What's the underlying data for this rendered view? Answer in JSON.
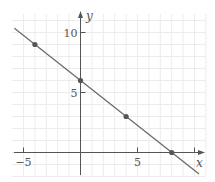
{
  "chart_data": {
    "type": "line",
    "title": "",
    "xlabel": "x",
    "ylabel": "y",
    "xlim": [
      -5.7,
      10.8
    ],
    "ylim": [
      -1.8,
      11.2
    ],
    "grid": true,
    "x_ticks": [
      {
        "value": -5,
        "label": "−5"
      },
      {
        "value": 5,
        "label": "5"
      },
      {
        "value": 10,
        "label": ""
      }
    ],
    "y_ticks": [
      {
        "value": 5,
        "label": "5"
      },
      {
        "value": 10,
        "label": "10"
      }
    ],
    "series": [
      {
        "name": "line",
        "equation": "y = 6 - 0.75x",
        "slope": -0.75,
        "intercept": 6,
        "x_range": [
          -5.8,
          10.4
        ],
        "points": [
          {
            "x": -4,
            "y": 9
          },
          {
            "x": 0,
            "y": 6
          },
          {
            "x": 4,
            "y": 3
          },
          {
            "x": 8,
            "y": 0
          }
        ]
      }
    ]
  },
  "colors": {
    "axis": "#555555",
    "line": "#6b6b6b",
    "point": "#555555",
    "grid": "#ececec"
  }
}
